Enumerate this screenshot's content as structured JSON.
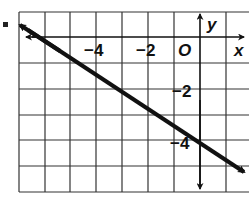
{
  "figure": {
    "bullet": "■",
    "axes": {
      "x_label": "x",
      "y_label": "y",
      "origin_label": "O",
      "x_tick_labels": [
        "−4",
        "−2"
      ],
      "y_tick_labels": [
        "−2",
        "−4"
      ]
    },
    "grid": {
      "x_range": [
        -7,
        1
      ],
      "y_range": [
        -6,
        1
      ],
      "step": 1
    },
    "line": {
      "equation": "y = -2/3 x - 4",
      "points": [
        [
          -6,
          0
        ],
        [
          0,
          -4
        ]
      ],
      "slope": -0.6667,
      "y_intercept": -4,
      "x_intercept": -6
    },
    "colors": {
      "ink": "#111111",
      "grid": "#333333",
      "background": "#ffffff"
    }
  }
}
